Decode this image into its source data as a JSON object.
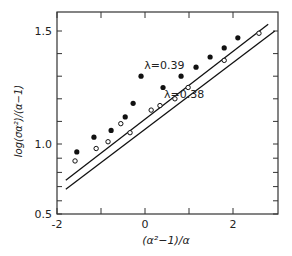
{
  "chart_data": {
    "type": "scatter",
    "title": "",
    "xlabel": "(α²−1)/α",
    "ylabel": "log(σα²)/(α−1)",
    "xlim": [
      -2,
      3
    ],
    "ylim": [
      0.5,
      1.55
    ],
    "x_ticks": [
      -2,
      -1,
      0,
      1,
      2
    ],
    "x_tick_labels": [
      "-2",
      "",
      "0",
      "",
      "2"
    ],
    "y_ticks": [
      0.5,
      0.6,
      0.7,
      0.8,
      0.9,
      1.0,
      1.1,
      1.2,
      1.3,
      1.4,
      1.5
    ],
    "y_tick_labels": {
      "0.5": "0.5",
      "1.0": "1.0",
      "1.5": "1.5"
    },
    "grid": false,
    "series": [
      {
        "name": "λ=0.39",
        "marker": "filled-circle",
        "points": [
          [
            -1.55,
            0.965
          ],
          [
            -1.16,
            1.03
          ],
          [
            -0.77,
            1.06
          ],
          [
            -0.45,
            1.12
          ],
          [
            -0.27,
            1.18
          ],
          [
            -0.09,
            1.3
          ],
          [
            0.41,
            1.25
          ],
          [
            0.82,
            1.3
          ],
          [
            1.16,
            1.34
          ],
          [
            1.48,
            1.385
          ],
          [
            1.8,
            1.425
          ],
          [
            2.11,
            1.47
          ]
        ],
        "fit_line": {
          "x": [
            -1.8,
            2.8
          ],
          "y": [
            0.84,
            1.53
          ]
        },
        "label": "λ=0.39",
        "label_pos": [
          0.55,
          1.33
        ]
      },
      {
        "name": "λ=0.38",
        "marker": "open-circle",
        "points": [
          [
            -1.59,
            0.925
          ],
          [
            -1.11,
            0.98
          ],
          [
            -0.84,
            1.01
          ],
          [
            -0.55,
            1.09
          ],
          [
            -0.34,
            1.05
          ],
          [
            0.14,
            1.15
          ],
          [
            0.34,
            1.17
          ],
          [
            0.68,
            1.2
          ],
          [
            0.98,
            1.25
          ],
          [
            1.8,
            1.37
          ],
          [
            2.59,
            1.49
          ]
        ],
        "fit_line": {
          "x": [
            -1.8,
            2.95
          ],
          "y": [
            0.8,
            1.5
          ]
        },
        "label": "λ=0.38",
        "label_pos": [
          1.0,
          1.205
        ]
      }
    ]
  },
  "labels": {
    "xlabel": "(α²−1)/α",
    "ylabel": "log(σα²)/(α−1)",
    "series_a": "λ=0.39",
    "series_b": "λ=0.38"
  }
}
